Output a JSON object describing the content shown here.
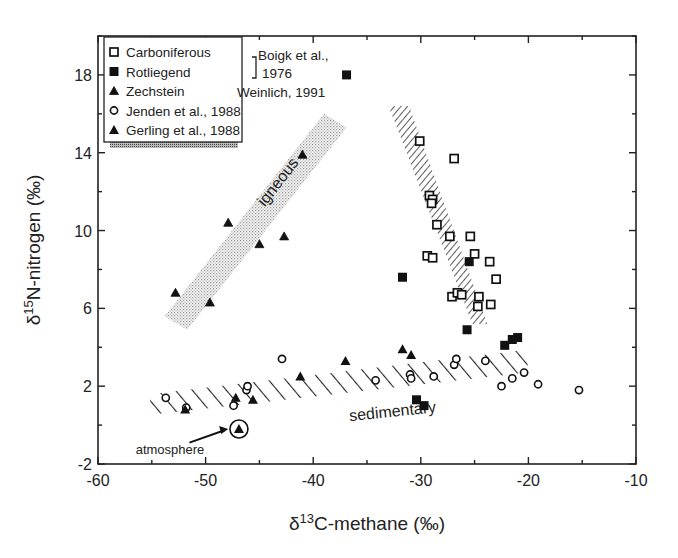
{
  "chart_data": {
    "type": "scatter",
    "title": "",
    "xlabel": "δ13C-methane (‰)",
    "xlabel_parts": {
      "prefix": "δ",
      "sup": "13",
      "rest": "C-methane (‰)"
    },
    "ylabel": "δ15N-nitrogen (‰)",
    "ylabel_parts": {
      "prefix": "δ",
      "sup": "15",
      "rest": "N-nitrogen (‰)"
    },
    "xlim": [
      -60,
      -10
    ],
    "ylim": [
      -2,
      20
    ],
    "xticks": [
      -60,
      -50,
      -40,
      -30,
      -20,
      -10
    ],
    "yticks": [
      -2,
      2,
      6,
      10,
      14,
      18
    ],
    "grid": false,
    "legend_position": "upper-left",
    "legend": {
      "entries": [
        {
          "marker": "open-square",
          "label": "Carboniferous"
        },
        {
          "marker": "filled-square",
          "label": "Rotliegend"
        },
        {
          "marker": "small-triangle",
          "label": "Zechstein"
        },
        {
          "marker": "open-circle",
          "label": "Jenden et al., 1988"
        },
        {
          "marker": "filled-triangle",
          "label": "Gerling et al., 1988"
        }
      ],
      "bracket_citation_line1": "Boigk et al.,",
      "bracket_citation_line2": "1976",
      "zechstein_citation": "Weinlich, 1991"
    },
    "series": [
      {
        "name": "Carboniferous",
        "source": "Boigk et al., 1976",
        "marker": "open-square",
        "points": [
          [
            -30.1,
            14.6
          ],
          [
            -26.9,
            13.7
          ],
          [
            -29.2,
            11.8
          ],
          [
            -28.9,
            11.6
          ],
          [
            -29.0,
            11.4
          ],
          [
            -28.5,
            10.3
          ],
          [
            -27.3,
            9.7
          ],
          [
            -25.4,
            9.7
          ],
          [
            -29.4,
            8.7
          ],
          [
            -28.9,
            8.6
          ],
          [
            -25.0,
            8.8
          ],
          [
            -23.6,
            8.4
          ],
          [
            -23.0,
            7.5
          ],
          [
            -27.1,
            6.6
          ],
          [
            -26.6,
            6.8
          ],
          [
            -26.2,
            6.7
          ],
          [
            -24.6,
            6.6
          ],
          [
            -24.7,
            6.1
          ],
          [
            -23.5,
            6.2
          ]
        ]
      },
      {
        "name": "Rotliegend",
        "source": "Boigk et al., 1976",
        "marker": "filled-square",
        "points": [
          [
            -36.9,
            18.0
          ],
          [
            -31.7,
            7.6
          ],
          [
            -25.5,
            8.4
          ],
          [
            -25.7,
            4.9
          ],
          [
            -22.2,
            4.1
          ],
          [
            -21.5,
            4.4
          ],
          [
            -21.0,
            4.5
          ],
          [
            -30.4,
            1.3
          ],
          [
            -29.7,
            1.0
          ]
        ]
      },
      {
        "name": "Zechstein",
        "source": "Weinlich, 1991",
        "marker": "small-triangle",
        "points": [
          [
            -52.8,
            6.8
          ],
          [
            -49.6,
            6.3
          ],
          [
            -47.9,
            10.4
          ],
          [
            -45.0,
            9.3
          ],
          [
            -42.7,
            9.7
          ],
          [
            -41.0,
            13.9
          ]
        ]
      },
      {
        "name": "Jenden et al., 1988",
        "marker": "open-circle",
        "points": [
          [
            -53.7,
            1.4
          ],
          [
            -51.8,
            0.9
          ],
          [
            -47.4,
            1.0
          ],
          [
            -46.2,
            1.8
          ],
          [
            -46.1,
            2.0
          ],
          [
            -42.9,
            3.4
          ],
          [
            -34.2,
            2.3
          ],
          [
            -31.0,
            2.6
          ],
          [
            -30.9,
            2.4
          ],
          [
            -28.8,
            2.5
          ],
          [
            -26.9,
            3.1
          ],
          [
            -26.7,
            3.4
          ],
          [
            -24.0,
            3.3
          ],
          [
            -22.5,
            2.0
          ],
          [
            -21.5,
            2.4
          ],
          [
            -20.4,
            2.7
          ],
          [
            -19.1,
            2.1
          ],
          [
            -15.3,
            1.8
          ]
        ]
      },
      {
        "name": "Gerling et al., 1988",
        "marker": "filled-triangle",
        "points": [
          [
            -51.9,
            0.8
          ],
          [
            -47.2,
            1.4
          ],
          [
            -45.6,
            1.3
          ],
          [
            -41.2,
            2.5
          ],
          [
            -37.0,
            3.3
          ],
          [
            -31.7,
            3.9
          ],
          [
            -30.9,
            3.6
          ],
          [
            -46.9,
            -0.2
          ]
        ]
      }
    ],
    "regions": [
      {
        "name": "igneous",
        "style": "stipple",
        "label": "igneous",
        "polygon": [
          [
            -53.8,
            5.6
          ],
          [
            -39.0,
            16.0
          ],
          [
            -36.9,
            15.3
          ],
          [
            -51.7,
            4.9
          ]
        ]
      },
      {
        "name": "sedimentary",
        "style": "hatch",
        "label": "sedimentary",
        "polygon": [
          [
            -55.5,
            0.5
          ],
          [
            -55.0,
            1.6
          ],
          [
            -19.8,
            3.9
          ],
          [
            -20.2,
            2.7
          ]
        ]
      },
      {
        "name": "thermogenic-trend",
        "style": "hatch-dense",
        "label": "",
        "polygon": [
          [
            -33.0,
            16.4
          ],
          [
            -31.1,
            16.4
          ],
          [
            -23.8,
            5.2
          ],
          [
            -25.2,
            5.2
          ]
        ]
      }
    ],
    "annotations": [
      {
        "text": "atmosphere",
        "x": -56.5,
        "y": -0.7,
        "arrow_to": [
          -47.9,
          -0.2
        ],
        "circle_at": [
          -46.9,
          -0.2
        ]
      }
    ]
  }
}
